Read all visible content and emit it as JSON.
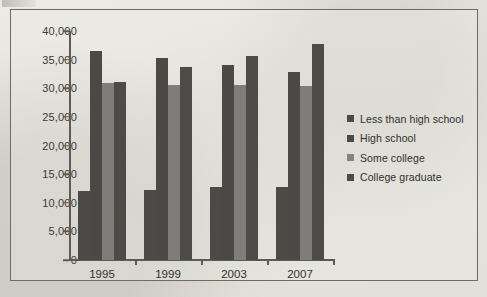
{
  "chart_data": {
    "type": "bar",
    "title": "",
    "subtitle": "",
    "xlabel": "",
    "ylabel": "",
    "categories": [
      "1995",
      "1999",
      "2003",
      "2007"
    ],
    "series": [
      {
        "name": "Less than high school",
        "color": "#4b4a47",
        "values": [
          12000,
          12300,
          12800,
          12700
        ]
      },
      {
        "name": "High school",
        "color": "#4a4946",
        "values": [
          36500,
          35200,
          34000,
          32800
        ]
      },
      {
        "name": "Some college",
        "color": "#7e7d79",
        "values": [
          31000,
          30500,
          30500,
          30400
        ]
      },
      {
        "name": "College graduate",
        "color": "#4c4b48",
        "values": [
          31100,
          33700,
          35700,
          37800
        ]
      }
    ],
    "ylim": [
      0,
      40000
    ],
    "ytick_values": [
      0,
      5000,
      10000,
      15000,
      20000,
      25000,
      30000,
      35000,
      40000
    ],
    "ytick_labels": [
      "0",
      "5,000",
      "10,000",
      "15,000",
      "20,000",
      "25,000",
      "30,000",
      "35,000",
      "40,000"
    ],
    "grid": false,
    "legend_position": "right",
    "legend_entries": [
      "Less than high school",
      "High school",
      "Some college",
      "College graduate"
    ],
    "background_color": "#e8e7e2",
    "axis_color": "#5d5b57",
    "frame_color": "#6d6b66"
  }
}
